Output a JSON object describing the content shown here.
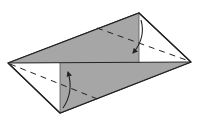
{
  "diagram": {
    "type": "origami-fold-step",
    "colors": {
      "background": "#ffffff",
      "paper_front": "#ffffff",
      "paper_back": "#a6a6a6",
      "line": "#222222"
    },
    "vertices": {
      "left": [
        8,
        63
      ],
      "top": [
        139,
        13
      ],
      "right": [
        191,
        62
      ],
      "bottom": [
        60,
        113
      ]
    },
    "fold_flaps": [
      {
        "name": "upper-flap",
        "points": [
          [
            8,
            63
          ],
          [
            139,
            13
          ],
          [
            139,
            63
          ]
        ]
      },
      {
        "name": "lower-flap",
        "points": [
          [
            60,
            63
          ],
          [
            191,
            62
          ],
          [
            60,
            113
          ]
        ]
      }
    ],
    "valley_fold_lines": [
      {
        "name": "upper-right-fold",
        "from": [
          97,
          27
        ],
        "to": [
          191,
          62
        ]
      },
      {
        "name": "lower-left-fold",
        "from": [
          8,
          63
        ],
        "to": [
          100,
          101
        ]
      }
    ],
    "arrows": [
      {
        "name": "upper-fold-arrow",
        "direction": "down"
      },
      {
        "name": "lower-fold-arrow",
        "direction": "up"
      }
    ]
  }
}
